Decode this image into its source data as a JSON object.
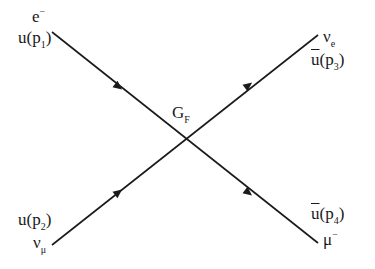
{
  "diagram": {
    "vertex": {
      "label_main": "G",
      "label_sub": "F",
      "x": 183,
      "y": 139
    },
    "lines": [
      {
        "id": "incoming-electron",
        "from": [
          52,
          32
        ],
        "to": [
          183,
          139
        ],
        "arrow_at": [
          112,
          82
        ],
        "direction": "in"
      },
      {
        "id": "incoming-muon-neutrino",
        "from": [
          52,
          245
        ],
        "to": [
          183,
          139
        ],
        "arrow_at": [
          112,
          197
        ],
        "direction": "in"
      },
      {
        "id": "outgoing-electron-neutrino",
        "from": [
          183,
          139
        ],
        "to": [
          318,
          35
        ],
        "arrow_at": [
          247,
          89
        ],
        "direction": "out"
      },
      {
        "id": "outgoing-muon",
        "from": [
          183,
          139
        ],
        "to": [
          318,
          243
        ],
        "arrow_at": [
          247,
          192
        ],
        "direction": "out"
      }
    ],
    "labels": {
      "top_left": {
        "particle_main": "e",
        "particle_sup": "−",
        "spinor_main": "u(p",
        "spinor_sub": "1",
        "spinor_close": ")"
      },
      "bottom_left": {
        "particle_main": "ν",
        "particle_sub": "μ",
        "spinor_main": "u(p",
        "spinor_sub": "2",
        "spinor_close": ")"
      },
      "top_right": {
        "particle_main": "ν",
        "particle_sub": "e",
        "spinor_bar": "u",
        "spinor_main": "(p",
        "spinor_sub": "3",
        "spinor_close": ")"
      },
      "bottom_right": {
        "particle_main": "μ",
        "particle_sup": "−",
        "spinor_bar": "u",
        "spinor_main": "(p",
        "spinor_sub": "4",
        "spinor_close": ")"
      }
    },
    "line_color": "#1a1a1a"
  }
}
